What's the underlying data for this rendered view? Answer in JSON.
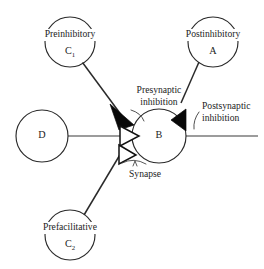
{
  "diagram": {
    "background_color": "#ffffff",
    "ink_color": "#1c1c1c",
    "filled_bouton_color": "#080808",
    "open_bouton_color": "#ffffff",
    "nodes": [
      {
        "id": "C1",
        "name": "preinhibitory-neuron",
        "title": "Preinhibitory",
        "symbol": "C",
        "subscript": "1",
        "role": "presynaptic inhibitory interneuron"
      },
      {
        "id": "A",
        "name": "postinhibitory-neuron",
        "title": "Postinhibitory",
        "symbol": "A",
        "subscript": "",
        "role": "postsynaptic inhibitory interneuron"
      },
      {
        "id": "D",
        "name": "presynaptic-neuron",
        "title": "",
        "symbol": "D",
        "subscript": "",
        "role": "presynaptic excitatory neuron"
      },
      {
        "id": "B",
        "name": "postsynaptic-neuron",
        "title": "",
        "symbol": "B",
        "subscript": "",
        "role": "postsynaptic target neuron"
      },
      {
        "id": "C2",
        "name": "prefacilitative-neuron",
        "title": "Prefacilitative",
        "symbol": "C",
        "subscript": "2",
        "role": "presynaptic facilitative interneuron"
      }
    ],
    "annotations": [
      {
        "id": "presynaptic-inhibition",
        "line1": "Presynaptic",
        "line2": "inhibition"
      },
      {
        "id": "postsynaptic-inhibition",
        "line1": "Postsynaptic",
        "line2": "inhibition"
      },
      {
        "id": "synapse",
        "line1": "Synapse",
        "line2": ""
      }
    ]
  }
}
